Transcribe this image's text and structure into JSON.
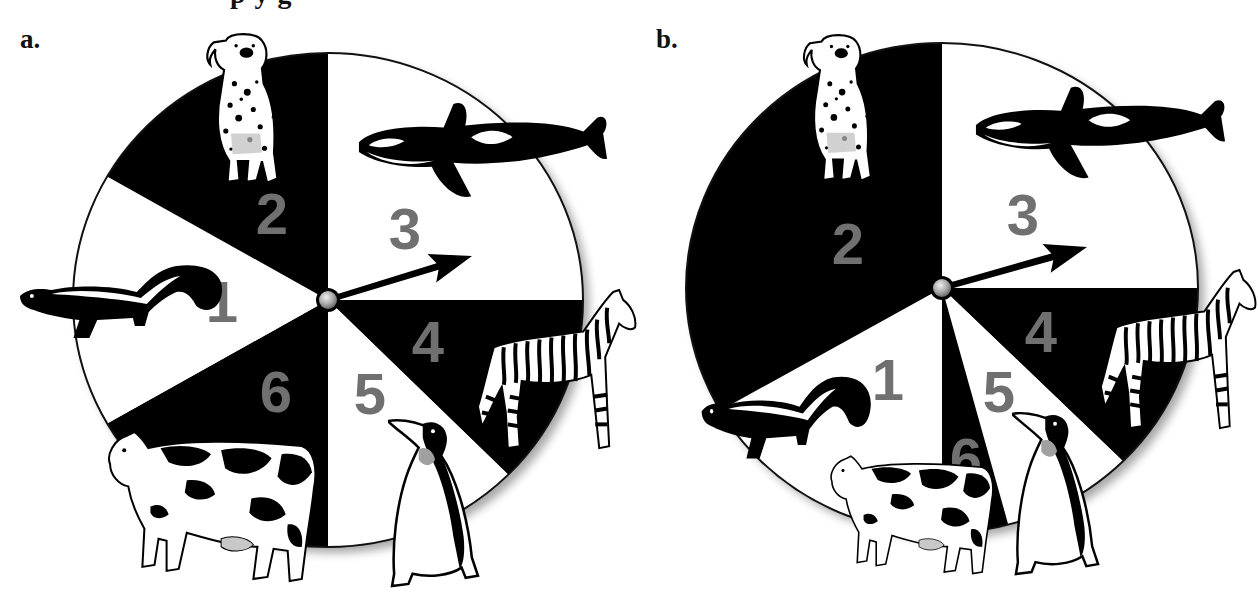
{
  "figure": {
    "heading_partial": "p        y                              g",
    "panels": [
      {
        "letter": "a.",
        "id": "a"
      },
      {
        "letter": "b.",
        "id": "b"
      }
    ]
  },
  "colors": {
    "dark_sector": "#000000",
    "light_sector": "#ffffff",
    "number_gray": "#707070",
    "outline": "#111111",
    "hub": "#b8b8b8"
  },
  "chart_data": [
    {
      "type": "pie",
      "title": "a.",
      "pointer_label": "arrow spinner",
      "pointer_points_to": "3",
      "sectors": [
        {
          "label": "1",
          "animal": "skunk",
          "degrees": 60,
          "fill": "white"
        },
        {
          "label": "2",
          "animal": "dalmatian dog",
          "degrees": 60,
          "fill": "black"
        },
        {
          "label": "3",
          "animal": "orca whale",
          "degrees": 90,
          "fill": "white"
        },
        {
          "label": "4",
          "animal": "zebra",
          "degrees": 45,
          "fill": "black"
        },
        {
          "label": "5",
          "animal": "penguin",
          "degrees": 45,
          "fill": "white"
        },
        {
          "label": "6",
          "animal": "cow",
          "degrees": 60,
          "fill": "black"
        }
      ],
      "fractions": {
        "1": 0.1667,
        "2": 0.1667,
        "3": 0.25,
        "4": 0.125,
        "5": 0.125,
        "6": 0.1667
      }
    },
    {
      "type": "pie",
      "title": "b.",
      "pointer_label": "arrow spinner",
      "pointer_points_to": "3",
      "sectors": [
        {
          "label": "1",
          "animal": "skunk",
          "degrees": 60,
          "fill": "white"
        },
        {
          "label": "2",
          "animal": "dalmatian dog",
          "degrees": 120,
          "fill": "black"
        },
        {
          "label": "3",
          "animal": "orca whale",
          "degrees": 90,
          "fill": "white"
        },
        {
          "label": "4",
          "animal": "zebra",
          "degrees": 45,
          "fill": "black"
        },
        {
          "label": "5",
          "animal": "penguin",
          "degrees": 30,
          "fill": "white"
        },
        {
          "label": "6",
          "animal": "cow",
          "degrees": 15,
          "fill": "black"
        }
      ],
      "fractions": {
        "1": 0.1667,
        "2": 0.3333,
        "3": 0.25,
        "4": 0.125,
        "5": 0.0833,
        "6": 0.0417
      }
    }
  ],
  "spinners": [
    {
      "id": "a",
      "center": [
        328,
        300
      ],
      "rx": 255,
      "ry": 247,
      "boundaries_deg": [
        -90,
        0,
        45,
        90,
        150,
        210
      ],
      "sector_fills": [
        "white",
        "black",
        "white",
        "black",
        "white",
        "black"
      ],
      "sector_labels_order": [
        "3",
        "4",
        "5",
        "6",
        "1",
        "2"
      ],
      "labels": [
        {
          "text": "1",
          "x": 222,
          "y": 301
        },
        {
          "text": "2",
          "x": 272,
          "y": 213
        },
        {
          "text": "3",
          "x": 405,
          "y": 228
        },
        {
          "text": "4",
          "x": 428,
          "y": 341
        },
        {
          "text": "5",
          "x": 370,
          "y": 393
        },
        {
          "text": "6",
          "x": 276,
          "y": 391
        }
      ],
      "arrow": {
        "tip": [
          472,
          256
        ],
        "angle_deg": -16
      },
      "animals": [
        {
          "name": "dog",
          "x": 200,
          "y": 32,
          "w": 86,
          "h": 155
        },
        {
          "name": "orca",
          "x": 355,
          "y": 98,
          "w": 256,
          "h": 108
        },
        {
          "name": "skunk",
          "x": 18,
          "y": 262,
          "w": 208,
          "h": 80
        },
        {
          "name": "zebra",
          "x": 474,
          "y": 288,
          "w": 164,
          "h": 168
        },
        {
          "name": "cow",
          "x": 100,
          "y": 428,
          "w": 222,
          "h": 156
        },
        {
          "name": "penguin",
          "x": 388,
          "y": 415,
          "w": 92,
          "h": 173
        }
      ]
    },
    {
      "id": "b",
      "center": [
        942,
        288
      ],
      "rx": 256,
      "ry": 245,
      "boundaries_deg": [
        -90,
        0,
        45,
        75,
        90,
        150
      ],
      "sector_fills": [
        "white",
        "black",
        "white",
        "black",
        "white",
        "black"
      ],
      "sector_labels_order": [
        "3",
        "4",
        "5",
        "6",
        "1",
        "2"
      ],
      "labels": [
        {
          "text": "1",
          "x": 888,
          "y": 379
        },
        {
          "text": "2",
          "x": 848,
          "y": 243
        },
        {
          "text": "3",
          "x": 1023,
          "y": 214
        },
        {
          "text": "4",
          "x": 1041,
          "y": 331
        },
        {
          "text": "5",
          "x": 999,
          "y": 391
        },
        {
          "text": "6",
          "x": 966,
          "y": 458
        }
      ],
      "arrow": {
        "tip": [
          1087,
          247
        ],
        "angle_deg": -16
      },
      "animals": [
        {
          "name": "dog",
          "x": 797,
          "y": 33,
          "w": 82,
          "h": 152
        },
        {
          "name": "orca",
          "x": 972,
          "y": 82,
          "w": 257,
          "h": 105
        },
        {
          "name": "skunk",
          "x": 700,
          "y": 373,
          "w": 174,
          "h": 90
        },
        {
          "name": "zebra",
          "x": 1097,
          "y": 268,
          "w": 161,
          "h": 168
        },
        {
          "name": "cow",
          "x": 824,
          "y": 453,
          "w": 174,
          "h": 123
        },
        {
          "name": "penguin",
          "x": 1012,
          "y": 408,
          "w": 88,
          "h": 168
        }
      ]
    }
  ]
}
